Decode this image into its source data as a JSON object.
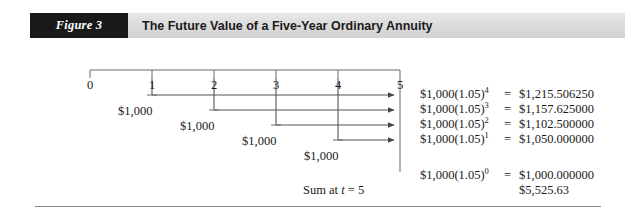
{
  "figure": {
    "tag": "Figure 3",
    "title": "The Future Value of a Five-Year Ordinary Annuity"
  },
  "timeline": {
    "tick_labels": [
      "0",
      "1",
      "2",
      "3",
      "4",
      "5"
    ],
    "tick_x": [
      90,
      152,
      214,
      276,
      338,
      400
    ],
    "axis_y": 70,
    "cash_flows": [
      {
        "label": "$1,000",
        "period": 1,
        "x": 118,
        "y": 113
      },
      {
        "label": "$1,000",
        "period": 2,
        "x": 180,
        "y": 128
      },
      {
        "label": "$1,000",
        "period": 3,
        "x": 242,
        "y": 143
      },
      {
        "label": "$1,000",
        "period": 4,
        "x": 304,
        "y": 158
      }
    ]
  },
  "equations": [
    {
      "expr_base": "$1,000(1.05)",
      "exponent": "4",
      "eq": "=",
      "value": "$1,215.506250"
    },
    {
      "expr_base": "$1,000(1.05)",
      "exponent": "3",
      "eq": "=",
      "value": "$1,157.625000"
    },
    {
      "expr_base": "$1,000(1.05)",
      "exponent": "2",
      "eq": "=",
      "value": "$1,102.500000"
    },
    {
      "expr_base": "$1,000(1.05)",
      "exponent": "1",
      "eq": "=",
      "value": "$1,050.000000"
    },
    {
      "expr_base": "$1,000(1.05)",
      "exponent": "0",
      "eq": "=",
      "value": "$1,000.000000"
    }
  ],
  "summary": {
    "sum_label_prefix": "Sum at ",
    "sum_label_var": "t",
    "sum_label_suffix": " = 5",
    "total": "$5,525.63"
  },
  "colors": {
    "tag_background": "#191919",
    "header_background": "#dcdcdc",
    "line": "#555555",
    "text": "#1a1a1a",
    "rule": "#8a8a8a"
  }
}
